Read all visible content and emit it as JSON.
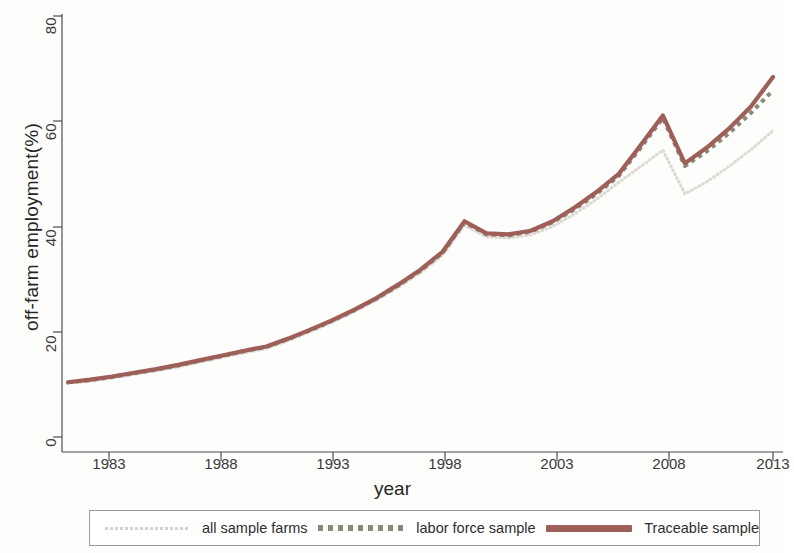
{
  "chart_data": {
    "type": "line",
    "title": "",
    "xlabel": "year",
    "ylabel": "off-farm employment(%)",
    "xlim": [
      1981,
      2013
    ],
    "ylim": [
      0,
      80
    ],
    "grid": false,
    "legend_position": "bottom",
    "x_ticks": [
      "1983",
      "1988",
      "1993",
      "1998",
      "2003",
      "2008",
      "2013"
    ],
    "y_ticks": [
      "0",
      "20",
      "40",
      "60",
      "80"
    ],
    "x": [
      1981,
      1982,
      1983,
      1984,
      1985,
      1986,
      1987,
      1988,
      1989,
      1990,
      1991,
      1992,
      1993,
      1994,
      1995,
      1996,
      1997,
      1998,
      1999,
      2000,
      2001,
      2002,
      2003,
      2004,
      2005,
      2006,
      2007,
      2008,
      2009,
      2010,
      2011,
      2012,
      2013
    ],
    "series": [
      {
        "name": "all sample farms",
        "style": "dotted",
        "color": "#dcdad4",
        "values": [
          10.2,
          10.6,
          11.2,
          11.9,
          12.6,
          13.3,
          14.2,
          15.1,
          16.0,
          16.8,
          18.3,
          20.0,
          21.8,
          23.8,
          26.0,
          28.5,
          31.2,
          34.5,
          40.2,
          38.0,
          37.8,
          38.4,
          40.0,
          42.4,
          45.2,
          48.4,
          51.4,
          54.5,
          46.2,
          48.5,
          51.4,
          54.6,
          58.2
        ]
      },
      {
        "name": "labor force sample",
        "style": "dashed",
        "color": "#8d8876",
        "values": [
          10.4,
          10.8,
          11.4,
          12.1,
          12.8,
          13.6,
          14.5,
          15.4,
          16.3,
          17.1,
          18.6,
          20.3,
          22.1,
          24.1,
          26.3,
          28.8,
          31.6,
          35.0,
          40.8,
          38.5,
          38.3,
          39.0,
          40.8,
          43.3,
          46.2,
          49.6,
          55.0,
          60.6,
          51.5,
          54.3,
          57.7,
          61.6,
          65.9
        ]
      },
      {
        "name": "Traceable sample",
        "style": "solid",
        "color": "#9d5f58",
        "values": [
          10.4,
          10.9,
          11.5,
          12.2,
          12.9,
          13.7,
          14.6,
          15.5,
          16.4,
          17.2,
          18.7,
          20.4,
          22.2,
          24.2,
          26.4,
          29.0,
          31.8,
          35.2,
          41.0,
          38.7,
          38.5,
          39.2,
          41.0,
          43.6,
          46.6,
          50.0,
          55.5,
          61.1,
          52.0,
          55.0,
          58.6,
          62.8,
          68.4
        ]
      }
    ]
  },
  "axes": {
    "ylabel": "off-farm employment(%)",
    "xlabel": "year",
    "yticks": [
      "80",
      "60",
      "40",
      "20",
      "0"
    ],
    "xticks": [
      "1983",
      "1988",
      "1993",
      "1998",
      "2003",
      "2008",
      "2013"
    ]
  },
  "legend": {
    "items": [
      {
        "label": "all sample farms",
        "swatch": "dotted-line-swatch"
      },
      {
        "label": "labor force sample",
        "swatch": "dashed-line-swatch"
      },
      {
        "label": "Traceable sample",
        "swatch": "solid-line-swatch"
      }
    ]
  },
  "colors": {
    "all_sample_farms": "#dcdad4",
    "labor_force_sample": "#8d8876",
    "traceable_sample": "#9d5f58",
    "axis": "#4d4d4d",
    "background": "#fdfdfc"
  }
}
